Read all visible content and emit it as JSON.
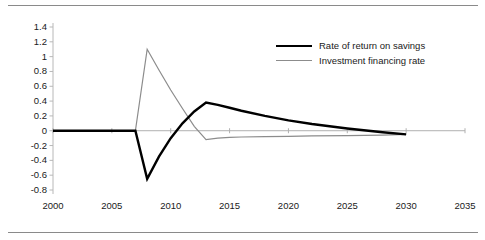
{
  "chart_data": {
    "type": "line",
    "title": "",
    "subtitle": "",
    "xlabel": "",
    "ylabel": "",
    "xlim": [
      2000,
      2035
    ],
    "ylim": [
      -0.8,
      1.4
    ],
    "xticks": [
      "2000",
      "2005",
      "2010",
      "2015",
      "2020",
      "2025",
      "2030",
      "2035"
    ],
    "yticks": [
      "1.4",
      "1.2",
      "1",
      "0.8",
      "0.6",
      "0.4",
      "0.2",
      "0",
      "-0.2",
      "-0.4",
      "-0.6",
      "-0.8"
    ],
    "grid": false,
    "legend_position": "top-right",
    "zero_line": true,
    "x": [
      2000,
      2005,
      2007,
      2008,
      2009,
      2010,
      2011,
      2012,
      2013,
      2014,
      2015,
      2016,
      2018,
      2020,
      2022,
      2025,
      2028,
      2030
    ],
    "series": [
      {
        "name": "Rate of return on savings",
        "color": "#000000",
        "width": 2.4,
        "values": [
          0,
          0,
          0,
          -0.65,
          -0.35,
          -0.1,
          0.1,
          0.26,
          0.38,
          0.35,
          0.31,
          0.27,
          0.2,
          0.14,
          0.09,
          0.03,
          -0.02,
          -0.05
        ]
      },
      {
        "name": "Investment financing rate",
        "color": "#8c8c8c",
        "width": 1.2,
        "values": [
          0,
          0,
          0,
          1.1,
          0.82,
          0.55,
          0.3,
          0.06,
          -0.12,
          -0.1,
          -0.09,
          -0.085,
          -0.08,
          -0.075,
          -0.07,
          -0.065,
          -0.06,
          -0.05
        ]
      }
    ]
  },
  "legend": {
    "items": [
      {
        "label": "Rate of return on savings"
      },
      {
        "label": "Investment financing rate"
      }
    ]
  }
}
